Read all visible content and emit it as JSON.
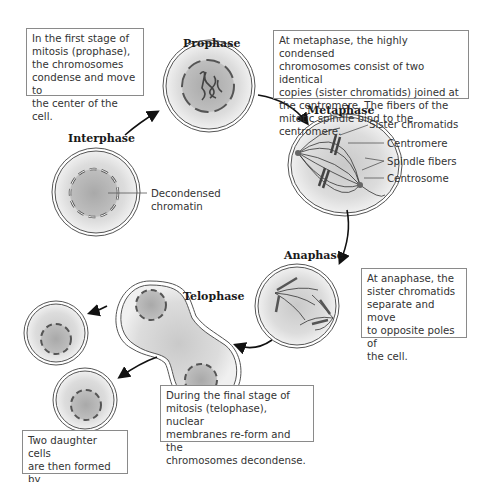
{
  "stages": {
    "interphase": "Interphase",
    "prophase": "Prophase",
    "metaphase": "Metaphase",
    "anaphase": "Anaphase",
    "telophase": "Telophase"
  },
  "annotations": {
    "prophase_box": "In the first stage of\nmitosis (prophase),\nthe chromosomes\ncondense and move to\nthe center of the cell.",
    "metaphase_box": "At metaphase, the highly condensed\nchromosomes consist of two identical\ncopies (sister chromatids) joined at\nthe centromere. The fibers of the\nmitotic spindle bind to the centromere.",
    "anaphase_box": "At anaphase, the\nsister chromatids\nseparate and move\nto opposite poles of\nthe cell.",
    "telophase_box": "During the final stage of\nmitosis (telophase), nuclear\nmembranes re-form and the\nchromosomes decondense.",
    "daughter_box": "Two daughter cells\nare then formed by\ncell division."
  },
  "labels": {
    "decondensed_chromatin": "Decondensed\nchromatin",
    "sister_chromatids": "Sister chromatids",
    "centromere": "Centromere",
    "spindle_fibers": "Spindle fibers",
    "centrosome": "Centrosome"
  },
  "colors": {
    "cell_fill": "#d6d6d6",
    "nucleus_fill": "#b8b8b8",
    "membrane": "#555555",
    "arrow": "#111111"
  }
}
